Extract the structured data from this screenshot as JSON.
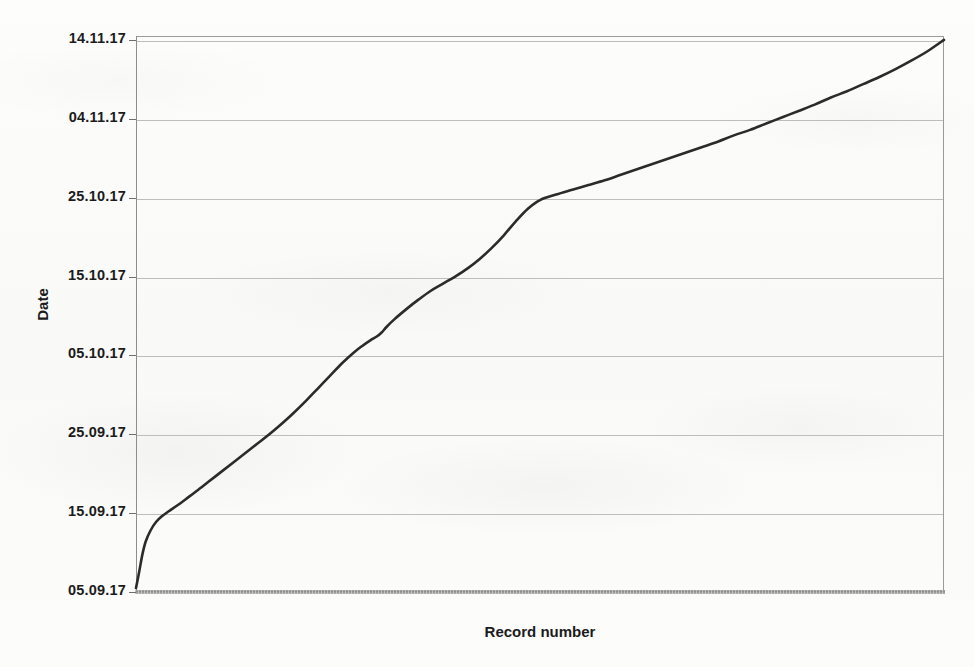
{
  "figure": {
    "background_color": "#fbfbfa",
    "axis_color": "#9a9a9a",
    "grid_color": "#bdbdbd",
    "curve_color": "#2b2b2b"
  },
  "axes": {
    "y_title": "Date",
    "x_title": "Record number"
  },
  "chart_data": {
    "type": "line",
    "title": "",
    "subtitle": "",
    "xlabel": "Record number",
    "ylabel": "Date",
    "grid": true,
    "grid_axis": "y",
    "legend": false,
    "legend_position": "none",
    "x_tick_labels": [],
    "y_tick_labels": [
      "05.09.17",
      "15.09.17",
      "25.09.17",
      "05.10.17",
      "15.10.17",
      "25.10.17",
      "04.11.17",
      "14.11.17"
    ],
    "y_tick_values": [
      0,
      10,
      20,
      30,
      40,
      50,
      60,
      70
    ],
    "ylim": [
      0,
      70.5
    ],
    "xlim": [
      0,
      100
    ],
    "series": [
      {
        "name": "cumulative records by date",
        "color": "#2b2b2b",
        "x": [
          0.0,
          0.4,
          0.8,
          1.2,
          1.8,
          2.5,
          3.2,
          4.0,
          5.0,
          6.2,
          7.5,
          9.0,
          10.5,
          12.0,
          13.5,
          15.0,
          16.5,
          18.0,
          19.5,
          21.0,
          22.5,
          24.0,
          25.5,
          27.0,
          28.0,
          29.0,
          29.8,
          30.4,
          31.0,
          32.0,
          33.5,
          35.0,
          36.5,
          38.0,
          39.5,
          41.0,
          42.5,
          44.0,
          45.5,
          47.0,
          48.5,
          50.0,
          52.0,
          54.0,
          56.0,
          58.0,
          60.0,
          62.0,
          64.0,
          66.0,
          68.0,
          70.0,
          72.0,
          74.0,
          76.0,
          78.0,
          80.0,
          82.0,
          84.0,
          86.0,
          88.0,
          90.0,
          92.0,
          94.0,
          96.0,
          98.0,
          100.0
        ],
        "y": [
          0.5,
          2.6,
          4.8,
          6.4,
          7.8,
          8.9,
          9.6,
          10.2,
          10.9,
          11.8,
          12.8,
          14.0,
          15.2,
          16.4,
          17.6,
          18.8,
          20.0,
          21.3,
          22.7,
          24.2,
          25.8,
          27.4,
          29.0,
          30.4,
          31.2,
          31.9,
          32.4,
          32.9,
          33.6,
          34.6,
          35.9,
          37.1,
          38.2,
          39.1,
          40.0,
          41.0,
          42.2,
          43.6,
          45.2,
          47.0,
          48.6,
          49.7,
          50.4,
          51.0,
          51.6,
          52.2,
          52.9,
          53.6,
          54.3,
          55.0,
          55.7,
          56.4,
          57.1,
          57.9,
          58.6,
          59.4,
          60.2,
          61.0,
          61.8,
          62.7,
          63.5,
          64.4,
          65.3,
          66.3,
          67.4,
          68.6,
          70.0
        ]
      }
    ],
    "annotations": []
  }
}
